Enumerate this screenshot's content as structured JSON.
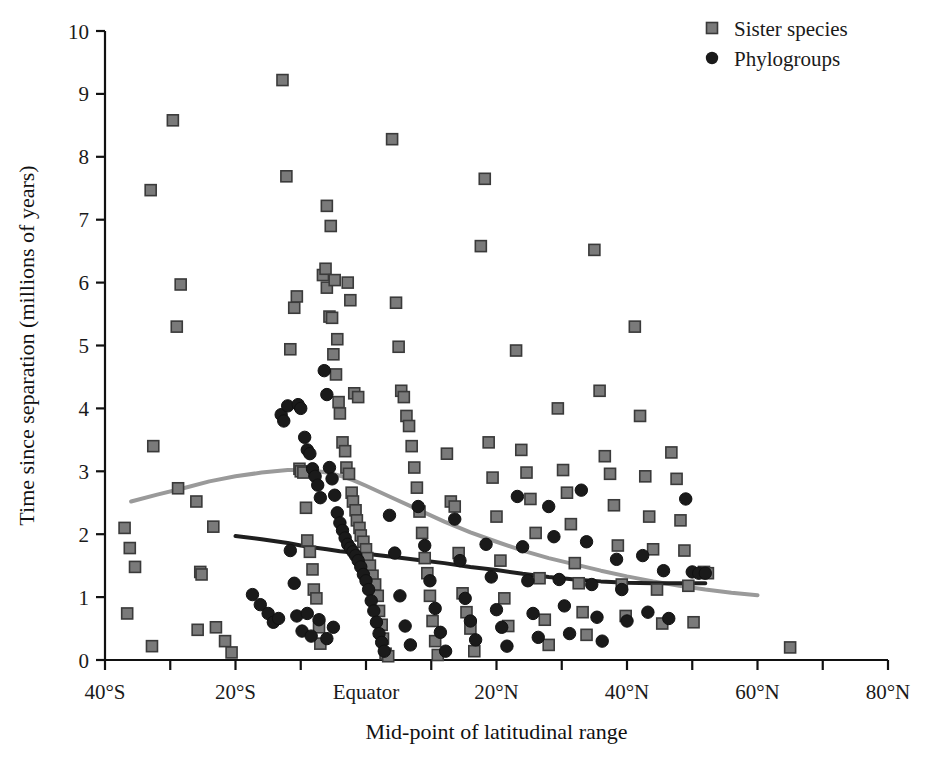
{
  "chart_data": {
    "type": "scatter",
    "title": "",
    "xlabel": "Mid-point of latitudinal range",
    "ylabel": "Time since separation (millions of years)",
    "xlim": [
      -40,
      80
    ],
    "ylim": [
      0,
      10
    ],
    "grid": false,
    "legend_position": "top-right",
    "xticklabels": [
      "40°S",
      "20°S",
      "Equator",
      "20°N",
      "40°N",
      "60°N",
      "80°N"
    ],
    "xtickvalues": [
      -40,
      -20,
      0,
      20,
      40,
      60,
      80
    ],
    "xminortickvalues": [
      -30,
      -10,
      10,
      30,
      50,
      70
    ],
    "yticklabels": [
      "0",
      "1",
      "2",
      "3",
      "4",
      "5",
      "6",
      "7",
      "8",
      "9",
      "10"
    ],
    "ytickvalues": [
      0,
      1,
      2,
      3,
      4,
      5,
      6,
      7,
      8,
      9,
      10
    ],
    "series": [
      {
        "name": "Sister species",
        "marker": "square",
        "color": "#7a7a7a",
        "edge_color": "#3a3a3a",
        "points": [
          [
            -37.0,
            2.1
          ],
          [
            -36.2,
            1.78
          ],
          [
            -35.4,
            1.48
          ],
          [
            -36.6,
            0.74
          ],
          [
            -33.0,
            7.47
          ],
          [
            -32.6,
            3.4
          ],
          [
            -32.8,
            0.22
          ],
          [
            -29.6,
            8.58
          ],
          [
            -29.0,
            5.3
          ],
          [
            -28.4,
            5.97
          ],
          [
            -28.8,
            2.73
          ],
          [
            -26.0,
            2.52
          ],
          [
            -25.4,
            1.4
          ],
          [
            -25.2,
            1.36
          ],
          [
            -25.8,
            0.48
          ],
          [
            -23.4,
            2.12
          ],
          [
            -23.0,
            0.52
          ],
          [
            -21.6,
            0.3
          ],
          [
            -20.6,
            0.12
          ],
          [
            -12.8,
            9.22
          ],
          [
            -12.2,
            7.69
          ],
          [
            -11.6,
            4.94
          ],
          [
            -11.0,
            5.6
          ],
          [
            -10.6,
            5.78
          ],
          [
            -10.2,
            3.04
          ],
          [
            -10.0,
            3.0
          ],
          [
            -9.6,
            2.98
          ],
          [
            -9.2,
            2.42
          ],
          [
            -9.0,
            1.9
          ],
          [
            -8.6,
            1.72
          ],
          [
            -8.2,
            1.44
          ],
          [
            -8.0,
            1.12
          ],
          [
            -7.6,
            0.98
          ],
          [
            -7.2,
            0.52
          ],
          [
            -7.0,
            0.26
          ],
          [
            -6.6,
            6.12
          ],
          [
            -6.2,
            6.22
          ],
          [
            -6.0,
            5.92
          ],
          [
            -5.6,
            5.46
          ],
          [
            -5.2,
            5.44
          ],
          [
            -5.0,
            4.86
          ],
          [
            -4.6,
            4.54
          ],
          [
            -4.2,
            4.1
          ],
          [
            -4.0,
            3.92
          ],
          [
            -3.6,
            3.46
          ],
          [
            -3.2,
            3.32
          ],
          [
            -3.0,
            3.06
          ],
          [
            -2.6,
            2.96
          ],
          [
            -2.2,
            2.66
          ],
          [
            -2.0,
            2.52
          ],
          [
            -1.6,
            2.38
          ],
          [
            -1.4,
            2.22
          ],
          [
            -1.0,
            2.1
          ],
          [
            -0.8,
            1.98
          ],
          [
            -0.4,
            1.88
          ],
          [
            0.0,
            1.76
          ],
          [
            0.2,
            1.62
          ],
          [
            0.6,
            1.5
          ],
          [
            1.0,
            1.34
          ],
          [
            1.4,
            1.2
          ],
          [
            1.8,
            1.02
          ],
          [
            2.0,
            0.78
          ],
          [
            2.4,
            0.56
          ],
          [
            2.6,
            0.34
          ],
          [
            3.0,
            0.1
          ],
          [
            3.4,
            0.06
          ],
          [
            -6.0,
            7.22
          ],
          [
            -5.4,
            6.9
          ],
          [
            -4.8,
            6.04
          ],
          [
            -4.4,
            5.1
          ],
          [
            -2.8,
            6.0
          ],
          [
            -2.4,
            5.72
          ],
          [
            -1.8,
            4.24
          ],
          [
            -1.2,
            4.18
          ],
          [
            4.0,
            8.28
          ],
          [
            4.6,
            5.68
          ],
          [
            5.0,
            4.98
          ],
          [
            5.4,
            4.28
          ],
          [
            5.8,
            4.18
          ],
          [
            6.2,
            3.88
          ],
          [
            6.6,
            3.72
          ],
          [
            7.0,
            3.4
          ],
          [
            7.4,
            3.06
          ],
          [
            7.8,
            2.74
          ],
          [
            8.2,
            2.36
          ],
          [
            8.6,
            2.02
          ],
          [
            9.0,
            1.62
          ],
          [
            9.4,
            1.38
          ],
          [
            9.8,
            1.02
          ],
          [
            10.2,
            0.62
          ],
          [
            10.6,
            0.3
          ],
          [
            11.0,
            0.08
          ],
          [
            12.4,
            3.28
          ],
          [
            13.0,
            2.52
          ],
          [
            13.6,
            2.44
          ],
          [
            14.2,
            1.7
          ],
          [
            14.8,
            1.06
          ],
          [
            15.4,
            0.76
          ],
          [
            16.0,
            0.5
          ],
          [
            16.6,
            0.14
          ],
          [
            17.6,
            6.58
          ],
          [
            18.2,
            7.65
          ],
          [
            18.8,
            3.46
          ],
          [
            19.4,
            2.9
          ],
          [
            20.0,
            2.28
          ],
          [
            20.6,
            1.58
          ],
          [
            21.2,
            0.98
          ],
          [
            21.8,
            0.54
          ],
          [
            23.0,
            4.92
          ],
          [
            23.8,
            3.34
          ],
          [
            24.6,
            2.98
          ],
          [
            25.2,
            2.56
          ],
          [
            26.0,
            2.02
          ],
          [
            26.6,
            1.3
          ],
          [
            27.4,
            0.64
          ],
          [
            28.0,
            0.24
          ],
          [
            29.4,
            4.0
          ],
          [
            30.2,
            3.02
          ],
          [
            30.8,
            2.66
          ],
          [
            31.4,
            2.16
          ],
          [
            32.0,
            1.54
          ],
          [
            32.6,
            1.22
          ],
          [
            33.2,
            0.76
          ],
          [
            33.8,
            0.4
          ],
          [
            35.0,
            6.52
          ],
          [
            35.8,
            4.28
          ],
          [
            36.6,
            3.24
          ],
          [
            37.4,
            2.96
          ],
          [
            38.0,
            2.46
          ],
          [
            38.6,
            1.82
          ],
          [
            39.2,
            1.2
          ],
          [
            39.8,
            0.7
          ],
          [
            41.2,
            5.3
          ],
          [
            42.0,
            3.88
          ],
          [
            42.8,
            2.92
          ],
          [
            43.4,
            2.28
          ],
          [
            44.0,
            1.76
          ],
          [
            44.6,
            1.12
          ],
          [
            45.4,
            0.58
          ],
          [
            46.8,
            3.3
          ],
          [
            47.6,
            2.88
          ],
          [
            48.2,
            2.22
          ],
          [
            48.8,
            1.74
          ],
          [
            49.4,
            1.18
          ],
          [
            50.2,
            0.6
          ],
          [
            51.8,
            1.4
          ],
          [
            52.4,
            1.38
          ],
          [
            65.0,
            0.2
          ]
        ]
      },
      {
        "name": "Phylogroups",
        "marker": "circle",
        "color": "#1a1a1a",
        "edge_color": "#111111",
        "points": [
          [
            -13.0,
            3.9
          ],
          [
            -12.6,
            3.8
          ],
          [
            -12.0,
            4.04
          ],
          [
            -10.4,
            4.06
          ],
          [
            -10.0,
            4.0
          ],
          [
            -9.4,
            3.54
          ],
          [
            -9.0,
            3.34
          ],
          [
            -8.6,
            3.28
          ],
          [
            -8.2,
            3.04
          ],
          [
            -7.8,
            2.92
          ],
          [
            -7.4,
            2.78
          ],
          [
            -7.0,
            2.58
          ],
          [
            -6.4,
            4.6
          ],
          [
            -6.0,
            4.22
          ],
          [
            -5.6,
            3.06
          ],
          [
            -5.2,
            2.88
          ],
          [
            -4.8,
            2.62
          ],
          [
            -4.4,
            2.34
          ],
          [
            -4.0,
            2.18
          ],
          [
            -3.6,
            2.06
          ],
          [
            -3.2,
            1.94
          ],
          [
            -2.8,
            1.84
          ],
          [
            -2.4,
            1.78
          ],
          [
            -2.0,
            1.72
          ],
          [
            -1.6,
            1.66
          ],
          [
            -1.2,
            1.58
          ],
          [
            -0.8,
            1.48
          ],
          [
            -0.4,
            1.36
          ],
          [
            0.0,
            1.26
          ],
          [
            0.4,
            1.12
          ],
          [
            0.8,
            0.94
          ],
          [
            1.2,
            0.78
          ],
          [
            1.6,
            0.6
          ],
          [
            2.0,
            0.42
          ],
          [
            2.4,
            0.28
          ],
          [
            2.8,
            0.14
          ],
          [
            -17.4,
            1.04
          ],
          [
            -16.2,
            0.88
          ],
          [
            -15.0,
            0.74
          ],
          [
            -14.2,
            0.6
          ],
          [
            -13.4,
            0.66
          ],
          [
            -11.6,
            1.74
          ],
          [
            -11.0,
            1.22
          ],
          [
            -10.6,
            0.7
          ],
          [
            -9.8,
            0.46
          ],
          [
            -9.0,
            0.74
          ],
          [
            -8.4,
            0.38
          ],
          [
            -7.2,
            0.64
          ],
          [
            -6.0,
            0.34
          ],
          [
            -5.0,
            0.52
          ],
          [
            3.6,
            2.3
          ],
          [
            4.4,
            1.7
          ],
          [
            5.2,
            1.02
          ],
          [
            6.0,
            0.54
          ],
          [
            6.8,
            0.24
          ],
          [
            8.0,
            2.44
          ],
          [
            9.0,
            1.82
          ],
          [
            9.8,
            1.26
          ],
          [
            10.6,
            0.82
          ],
          [
            11.4,
            0.44
          ],
          [
            12.2,
            0.14
          ],
          [
            13.6,
            2.24
          ],
          [
            14.4,
            1.58
          ],
          [
            15.2,
            0.98
          ],
          [
            16.0,
            0.62
          ],
          [
            16.8,
            0.32
          ],
          [
            18.4,
            1.84
          ],
          [
            19.2,
            1.32
          ],
          [
            20.0,
            0.8
          ],
          [
            20.8,
            0.52
          ],
          [
            21.6,
            0.22
          ],
          [
            23.2,
            2.6
          ],
          [
            24.0,
            1.8
          ],
          [
            24.8,
            1.26
          ],
          [
            25.6,
            0.74
          ],
          [
            26.4,
            0.36
          ],
          [
            28.0,
            2.44
          ],
          [
            28.8,
            1.96
          ],
          [
            29.6,
            1.28
          ],
          [
            30.4,
            0.86
          ],
          [
            31.2,
            0.42
          ],
          [
            33.0,
            2.7
          ],
          [
            33.8,
            1.88
          ],
          [
            34.6,
            1.2
          ],
          [
            35.4,
            0.68
          ],
          [
            36.2,
            0.3
          ],
          [
            38.4,
            1.6
          ],
          [
            39.2,
            1.12
          ],
          [
            40.0,
            0.62
          ],
          [
            42.4,
            1.66
          ],
          [
            43.2,
            0.76
          ],
          [
            45.6,
            1.42
          ],
          [
            46.4,
            0.66
          ],
          [
            49.0,
            2.56
          ],
          [
            50.0,
            1.4
          ],
          [
            51.0,
            1.38
          ],
          [
            52.0,
            1.38
          ]
        ]
      }
    ],
    "trend_lines": [
      {
        "name": "Sister species trend",
        "color": "#9a9a9a",
        "width": 4,
        "points": [
          [
            -36.0,
            2.52
          ],
          [
            -32.0,
            2.63
          ],
          [
            -28.0,
            2.73
          ],
          [
            -24.0,
            2.84
          ],
          [
            -20.0,
            2.92
          ],
          [
            -16.0,
            2.98
          ],
          [
            -12.0,
            3.02
          ],
          [
            -10.0,
            3.02
          ],
          [
            -8.0,
            3.01
          ],
          [
            -6.0,
            2.98
          ],
          [
            -4.0,
            2.93
          ],
          [
            -2.0,
            2.86
          ],
          [
            0.0,
            2.77
          ],
          [
            4.0,
            2.58
          ],
          [
            8.0,
            2.39
          ],
          [
            12.0,
            2.2
          ],
          [
            16.0,
            2.03
          ],
          [
            20.0,
            1.88
          ],
          [
            24.0,
            1.74
          ],
          [
            28.0,
            1.62
          ],
          [
            32.0,
            1.52
          ],
          [
            36.0,
            1.42
          ],
          [
            40.0,
            1.33
          ],
          [
            44.0,
            1.25
          ],
          [
            48.0,
            1.18
          ],
          [
            52.0,
            1.12
          ],
          [
            56.0,
            1.07
          ],
          [
            60.0,
            1.03
          ]
        ]
      },
      {
        "name": "Phylogroups trend",
        "color": "#1f1f1f",
        "width": 4,
        "points": [
          [
            -20.0,
            1.97
          ],
          [
            -16.0,
            1.92
          ],
          [
            -12.0,
            1.86
          ],
          [
            -10.0,
            1.82
          ],
          [
            -8.0,
            1.79
          ],
          [
            -6.0,
            1.76
          ],
          [
            -4.0,
            1.73
          ],
          [
            -2.0,
            1.71
          ],
          [
            0.0,
            1.69
          ],
          [
            4.0,
            1.64
          ],
          [
            8.0,
            1.59
          ],
          [
            12.0,
            1.54
          ],
          [
            16.0,
            1.48
          ],
          [
            20.0,
            1.43
          ],
          [
            24.0,
            1.37
          ],
          [
            28.0,
            1.32
          ],
          [
            32.0,
            1.28
          ],
          [
            36.0,
            1.25
          ],
          [
            40.0,
            1.23
          ],
          [
            44.0,
            1.22
          ],
          [
            48.0,
            1.22
          ],
          [
            52.0,
            1.22
          ]
        ]
      }
    ],
    "legend": [
      {
        "label": "Sister species",
        "marker": "square",
        "color": "#7a7a7a"
      },
      {
        "label": "Phylogroups",
        "marker": "circle",
        "color": "#1a1a1a"
      }
    ]
  }
}
